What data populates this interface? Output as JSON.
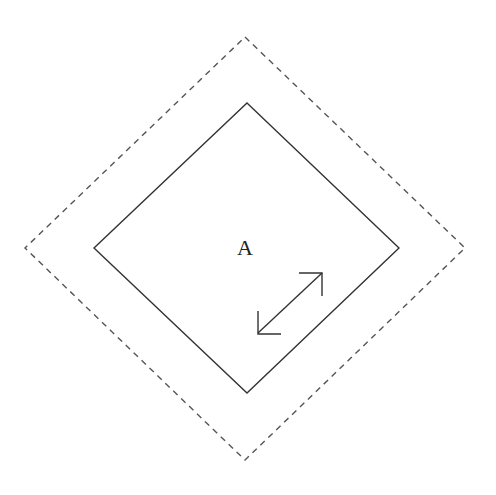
{
  "diagram": {
    "label": "A",
    "outer_region": {
      "style": "dashed",
      "shape": "diamond",
      "points": [
        [
          245,
          37
        ],
        [
          465,
          248
        ],
        [
          245,
          460
        ],
        [
          25,
          248
        ]
      ]
    },
    "inner_region": {
      "style": "solid",
      "shape": "diamond",
      "points": [
        [
          247,
          103
        ],
        [
          399,
          248
        ],
        [
          247,
          393
        ],
        [
          94,
          248
        ]
      ]
    },
    "arrow": {
      "type": "double-headed",
      "from": [
        257,
        334
      ],
      "to": [
        322,
        272
      ]
    },
    "colors": {
      "stroke": "#333333",
      "dashed_stroke": "#555555",
      "background": "#ffffff"
    }
  }
}
